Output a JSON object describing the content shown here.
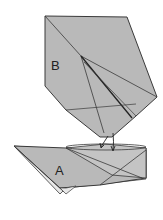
{
  "diagram": {
    "type": "origami-fold-step",
    "labels": {
      "flap_b": "B",
      "flap_a": "A"
    },
    "colors": {
      "paper": "#b9b9b9",
      "paper_light": "#cfcfcf",
      "paper_white": "#e8e8e8",
      "edge": "#3a3a3a",
      "background": "#ffffff"
    },
    "arrows": 2
  }
}
